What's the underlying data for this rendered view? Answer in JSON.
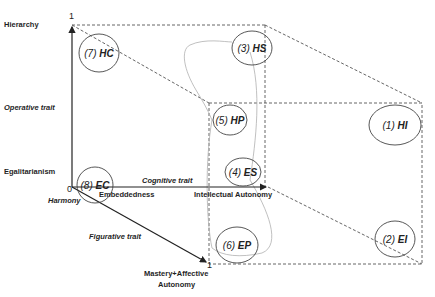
{
  "axes": {
    "vertical": {
      "top_label": "Hierarchy",
      "bottom_label": "Egalitarianism",
      "trait": "Operative trait",
      "max_tick": "1"
    },
    "horizontal": {
      "left_label": "Embeddedness",
      "right_label": "Intellectual Autonomy",
      "trait": "Cognitive trait"
    },
    "diagonal": {
      "end_label_line1": "Mastery+Affective",
      "end_label_line2": "Autonomy",
      "trait": "Figurative trait",
      "max_tick": "1"
    },
    "origin": {
      "tick": "0",
      "label": "Harmony"
    }
  },
  "nodes": [
    {
      "num": "(1)",
      "code": "HI"
    },
    {
      "num": "(2)",
      "code": "EI"
    },
    {
      "num": "(3)",
      "code": "HS"
    },
    {
      "num": "(4)",
      "code": "ES"
    },
    {
      "num": "(5)",
      "code": "HP"
    },
    {
      "num": "(6)",
      "code": "EP"
    },
    {
      "num": "(7)",
      "code": "HC"
    },
    {
      "num": "(8)",
      "code": "EC"
    }
  ],
  "colors": {
    "axis": "#333333",
    "dash": "#555555",
    "curve": "#a8a8a8",
    "ellipse": "#444444"
  }
}
